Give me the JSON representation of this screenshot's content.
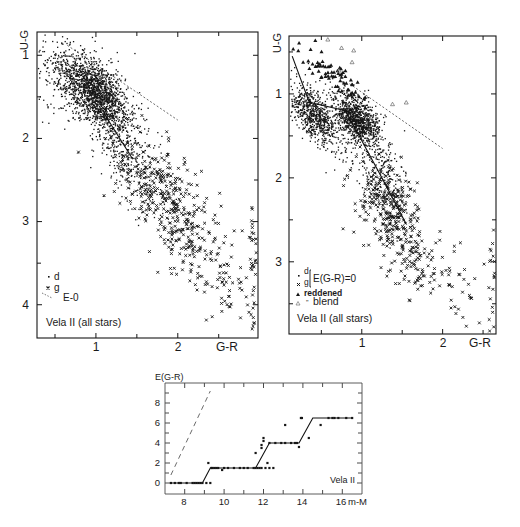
{
  "chart_data": [
    {
      "id": "left",
      "type": "scatter",
      "title": "",
      "annotation": "Vela II   (all stars)",
      "xlabel": "G-R",
      "ylabel": "U-G",
      "xlim": [
        0.28,
        2.98
      ],
      "ylim": [
        0.72,
        4.4
      ],
      "y_inverted": true,
      "x_ticks": [
        1,
        2
      ],
      "x_minor_ticks": [
        0.5,
        1.5,
        2.5
      ],
      "y_ticks": [
        1,
        2,
        3,
        4
      ],
      "y_minor_ticks": [
        1.5,
        2.5,
        3.5
      ],
      "legend": [
        {
          "symbol": "dot",
          "label": "d"
        },
        {
          "symbol": "cross",
          "label": "g"
        },
        {
          "symbol": "dashed-line",
          "label": "E-0"
        }
      ],
      "lines": [
        {
          "name": "E=0 reference",
          "style": "dashed",
          "points": [
            [
              0.65,
              0.88
            ],
            [
              2.0,
              1.78
            ]
          ]
        },
        {
          "name": "main sequence",
          "style": "solid",
          "points": [
            [
              1.1,
              1.7
            ],
            [
              1.45,
              2.25
            ]
          ]
        }
      ],
      "series": [
        {
          "name": "d",
          "marker": "dot",
          "clusters": [
            {
              "cx": 1.0,
              "cy": 1.45,
              "sx": 0.2,
              "sy": 0.18,
              "n": 1400
            },
            {
              "cx": 0.75,
              "cy": 1.35,
              "sx": 0.35,
              "sy": 0.28,
              "n": 450
            },
            {
              "cx": 1.3,
              "cy": 2.05,
              "sx": 0.18,
              "sy": 0.28,
              "n": 260
            },
            {
              "cx": 1.6,
              "cy": 2.5,
              "sx": 0.18,
              "sy": 0.25,
              "n": 120
            }
          ]
        },
        {
          "name": "g",
          "marker": "cross",
          "clusters": [
            {
              "cx": 1.75,
              "cy": 2.6,
              "sx": 0.3,
              "sy": 0.3,
              "n": 220
            },
            {
              "cx": 2.1,
              "cy": 3.1,
              "sx": 0.22,
              "sy": 0.3,
              "n": 170
            },
            {
              "cx": 2.6,
              "cy": 3.7,
              "sx": 0.25,
              "sy": 0.35,
              "n": 50
            },
            {
              "cx": 2.92,
              "cy": 3.5,
              "sx": 0.03,
              "sy": 0.5,
              "n": 40
            }
          ]
        }
      ]
    },
    {
      "id": "right",
      "type": "scatter",
      "title": "",
      "annotation": "Vela II   (all stars)",
      "xlabel": "G-R",
      "ylabel": "U-G",
      "xlim": [
        0.1,
        2.66
      ],
      "ylim": [
        0.31,
        3.86
      ],
      "y_inverted": true,
      "x_ticks": [
        1,
        2
      ],
      "x_minor_ticks": [
        0.5,
        1.5,
        2.5
      ],
      "y_ticks": [
        1,
        2,
        3
      ],
      "y_minor_ticks": [
        0.5,
        1.5,
        2.5,
        3.5
      ],
      "legend": [
        {
          "symbol": "dot",
          "label": "d"
        },
        {
          "symbol": "cross",
          "label": "g"
        },
        {
          "symbol": "bracket",
          "label": "E(G-R)=0"
        },
        {
          "symbol": "filled-triangle",
          "label": "reddened"
        },
        {
          "symbol": "open-triangle",
          "label": "blend"
        }
      ],
      "lines": [
        {
          "name": "E=0 reference",
          "style": "dashed",
          "points": [
            [
              0.85,
              0.88
            ],
            [
              2.0,
              1.65
            ]
          ]
        },
        {
          "name": "intrinsic sequence",
          "style": "solid",
          "points": [
            [
              0.14,
              0.55
            ],
            [
              0.35,
              1.1
            ],
            [
              0.8,
              1.2
            ],
            [
              1.25,
              2.0
            ],
            [
              1.55,
              2.55
            ]
          ]
        }
      ],
      "series": [
        {
          "name": "d",
          "marker": "dot",
          "clusters": [
            {
              "cx": 0.4,
              "cy": 1.25,
              "sx": 0.15,
              "sy": 0.12,
              "n": 550
            },
            {
              "cx": 0.95,
              "cy": 1.3,
              "sx": 0.13,
              "sy": 0.12,
              "n": 900
            },
            {
              "cx": 0.6,
              "cy": 1.35,
              "sx": 0.3,
              "sy": 0.2,
              "n": 300
            },
            {
              "cx": 1.25,
              "cy": 1.95,
              "sx": 0.14,
              "sy": 0.25,
              "n": 250
            }
          ]
        },
        {
          "name": "g",
          "marker": "cross",
          "clusters": [
            {
              "cx": 1.35,
              "cy": 2.35,
              "sx": 0.18,
              "sy": 0.28,
              "n": 250
            },
            {
              "cx": 1.6,
              "cy": 2.9,
              "sx": 0.2,
              "sy": 0.25,
              "n": 110
            },
            {
              "cx": 2.2,
              "cy": 3.35,
              "sx": 0.25,
              "sy": 0.3,
              "n": 45
            },
            {
              "cx": 2.62,
              "cy": 3.1,
              "sx": 0.02,
              "sy": 0.45,
              "n": 20
            }
          ]
        },
        {
          "name": "reddened",
          "marker": "filled-triangle",
          "clusters": [
            {
              "cx": 0.55,
              "cy": 0.72,
              "sx": 0.18,
              "sy": 0.08,
              "n": 55
            },
            {
              "cx": 0.8,
              "cy": 0.85,
              "sx": 0.08,
              "sy": 0.1,
              "n": 15
            }
          ]
        },
        {
          "name": "blend",
          "marker": "open-triangle",
          "points": [
            [
              0.58,
              0.35
            ],
            [
              0.75,
              0.45
            ],
            [
              0.9,
              0.48
            ],
            [
              0.72,
              0.72
            ],
            [
              0.88,
              0.62
            ],
            [
              1.38,
              1.12
            ],
            [
              1.55,
              1.1
            ]
          ]
        }
      ]
    },
    {
      "id": "bottom",
      "type": "line",
      "title": "",
      "annotation": "Vela II",
      "xlabel": "m-M",
      "ylabel": "E(G-R)",
      "xlim": [
        7.0,
        17.0
      ],
      "ylim": [
        -1.1,
        10.0
      ],
      "x_ticks": [
        8,
        10,
        12,
        14,
        16
      ],
      "x_minor_ticks": [
        9,
        11,
        13,
        15
      ],
      "y_ticks": [
        0,
        2,
        4,
        6,
        8
      ],
      "y_minor_ticks": [
        1,
        3,
        5,
        7,
        9
      ],
      "tick_labels_x": [
        "8",
        "10",
        "12",
        "14",
        "16 m-M"
      ],
      "tick_labels_y": [
        "0",
        "2",
        "4",
        "6",
        "8"
      ],
      "lines": [
        {
          "name": "extinction model",
          "style": "solid",
          "points": [
            [
              7.3,
              0.0
            ],
            [
              8.9,
              0.0
            ],
            [
              9.3,
              1.5
            ],
            [
              11.6,
              1.5
            ],
            [
              12.3,
              4.0
            ],
            [
              13.8,
              4.0
            ],
            [
              14.5,
              6.5
            ],
            [
              16.5,
              6.5
            ]
          ]
        },
        {
          "name": "reference slope",
          "style": "dashed",
          "points": [
            [
              7.3,
              0.8
            ],
            [
              9.3,
              9.2
            ]
          ]
        }
      ],
      "series": [
        {
          "name": "stars",
          "marker": "dot",
          "points": [
            [
              7.3,
              0
            ],
            [
              7.5,
              0
            ],
            [
              7.7,
              0
            ],
            [
              7.8,
              0
            ],
            [
              8.1,
              0
            ],
            [
              8.4,
              0
            ],
            [
              8.5,
              0
            ],
            [
              8.6,
              0
            ],
            [
              8.7,
              0
            ],
            [
              8.8,
              0
            ],
            [
              8.9,
              0
            ],
            [
              9.1,
              0
            ],
            [
              9.3,
              0
            ],
            [
              9.2,
              2.0
            ],
            [
              9.35,
              1.5
            ],
            [
              9.4,
              1.5
            ],
            [
              9.5,
              1.5
            ],
            [
              9.6,
              1.5
            ],
            [
              9.7,
              1.5
            ],
            [
              9.9,
              1.3
            ],
            [
              10.0,
              1.5
            ],
            [
              10.2,
              1.5
            ],
            [
              10.5,
              1.5
            ],
            [
              10.8,
              1.5
            ],
            [
              11.0,
              1.5
            ],
            [
              11.2,
              1.5
            ],
            [
              11.5,
              1.5
            ],
            [
              11.6,
              1.5
            ],
            [
              11.7,
              1.5
            ],
            [
              11.6,
              3.0
            ],
            [
              11.8,
              1.5
            ],
            [
              11.9,
              1.5
            ],
            [
              11.9,
              3.5
            ],
            [
              11.9,
              3.8
            ],
            [
              12.0,
              4.2
            ],
            [
              12.0,
              4.5
            ],
            [
              12.1,
              1.5
            ],
            [
              12.2,
              2.0
            ],
            [
              12.3,
              1.5
            ],
            [
              12.5,
              1.5
            ],
            [
              12.3,
              4.0
            ],
            [
              12.6,
              4.0
            ],
            [
              12.9,
              4.0
            ],
            [
              13.1,
              4.0
            ],
            [
              13.1,
              5.8
            ],
            [
              13.4,
              4.0
            ],
            [
              13.6,
              4.0
            ],
            [
              13.7,
              4.0
            ],
            [
              13.8,
              3.6
            ],
            [
              13.9,
              6.5
            ],
            [
              13.95,
              6.5
            ],
            [
              14.3,
              4.5
            ],
            [
              14.9,
              5.8
            ],
            [
              15.3,
              6.5
            ],
            [
              15.5,
              6.5
            ],
            [
              15.6,
              6.5
            ],
            [
              15.8,
              6.5
            ],
            [
              16.2,
              6.5
            ],
            [
              16.5,
              6.5
            ]
          ]
        }
      ]
    }
  ],
  "panels": {
    "left": {
      "ylabel": "U-G",
      "xlabel": "G-R",
      "ytick_labels": [
        "1",
        "2",
        "3",
        "4"
      ],
      "xtick_labels": [
        "1",
        "2"
      ],
      "legend_d": "d",
      "legend_g": "g",
      "legend_e": "E-0",
      "caption": "Vela II   (all stars)"
    },
    "right": {
      "ylabel": "U-G",
      "xlabel": "G-R",
      "ytick_labels": [
        "1",
        "2",
        "3"
      ],
      "xtick_labels": [
        "1",
        "2"
      ],
      "legend_d": "d",
      "legend_g": "g",
      "legend_e": "E(G-R)=0",
      "legend_reddened": "reddened",
      "legend_blend": "blend",
      "caption": "Vela II   (all stars)"
    },
    "bottom": {
      "ylabel": "E(G-R)",
      "xlabel": "m-M",
      "ytick_labels": [
        "0",
        "2",
        "4",
        "6",
        "8"
      ],
      "xtick_labels": [
        "8",
        "10",
        "12",
        "14",
        "16"
      ],
      "caption": "Vela II"
    }
  },
  "colors": {
    "ink": "#161616",
    "light_ink": "#555555",
    "background": "#ffffff"
  }
}
